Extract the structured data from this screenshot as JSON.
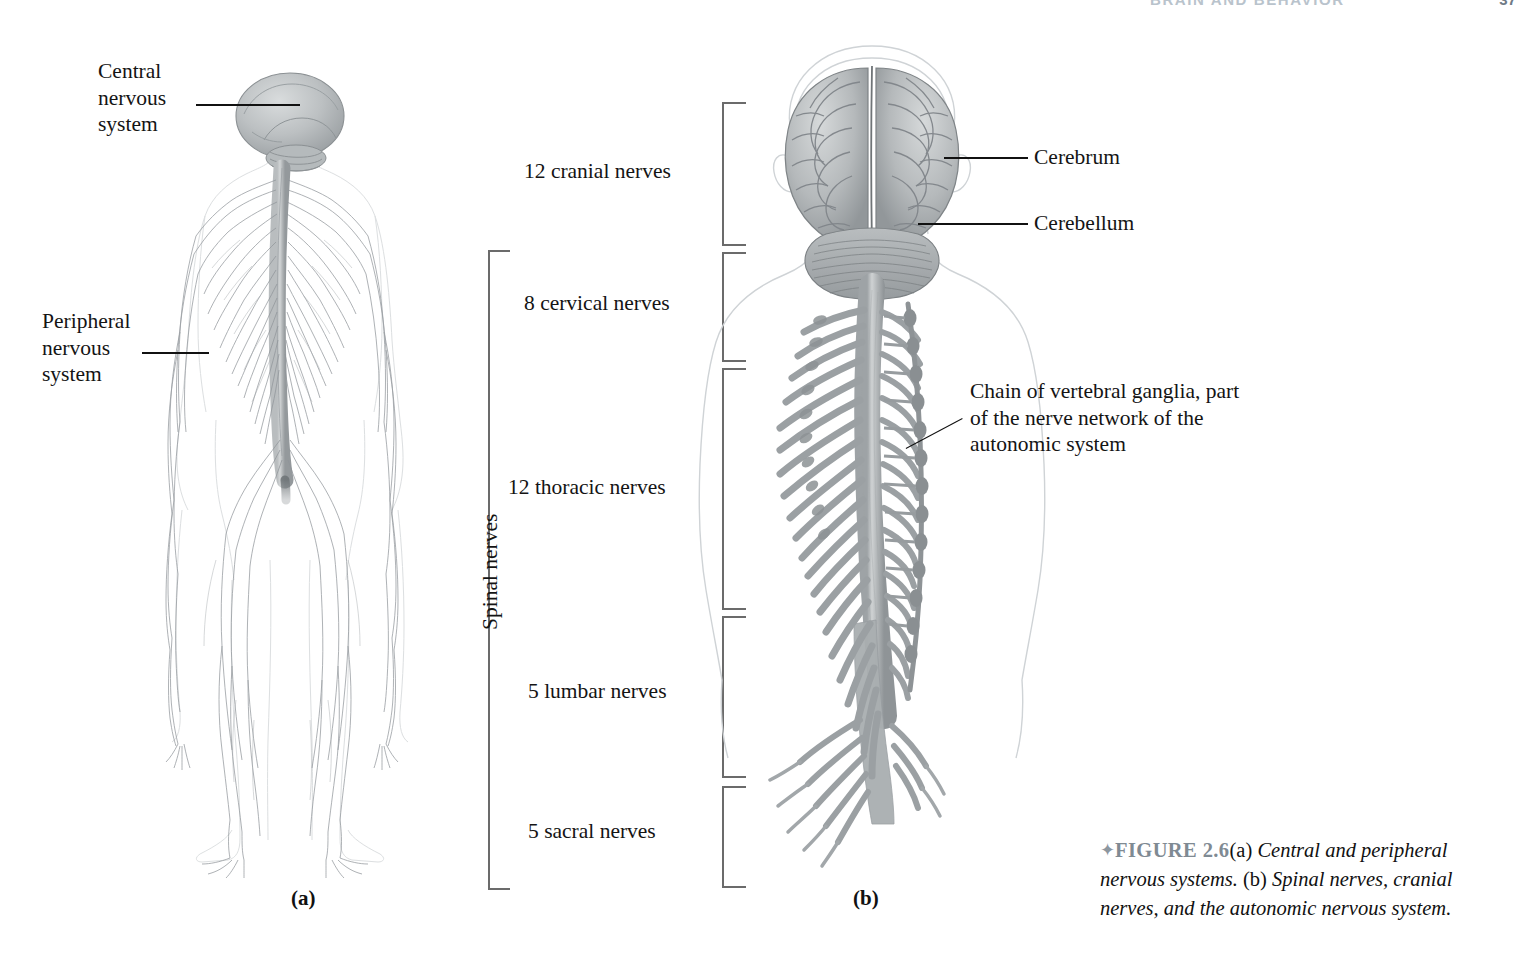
{
  "running_head": {
    "text": "BRAIN AND BEHAVIOR",
    "page": "37"
  },
  "panel_a": {
    "letter": "(a)",
    "labels": [
      {
        "id": "central-nervous-system",
        "text": "Central\nnervous\nsystem"
      },
      {
        "id": "peripheral-nervous-system",
        "text": "Peripheral\nnervous\nsystem"
      }
    ]
  },
  "panel_b": {
    "letter": "(b)",
    "labels": [
      {
        "id": "cerebrum",
        "text": "Cerebrum"
      },
      {
        "id": "cerebellum",
        "text": "Cerebellum"
      },
      {
        "id": "vertebral-ganglia",
        "text": "Chain of vertebral ganglia, part\nof the nerve network of the\nautonomic system"
      }
    ]
  },
  "nerve_groups": {
    "spinal_bracket_label": "Spinal nerves",
    "items": [
      {
        "id": "cranial",
        "label": "12 cranial nerves"
      },
      {
        "id": "cervical",
        "label": "8 cervical nerves"
      },
      {
        "id": "thoracic",
        "label": "12 thoracic nerves"
      },
      {
        "id": "lumbar",
        "label": "5 lumbar nerves"
      },
      {
        "id": "sacral",
        "label": "5 sacral nerves"
      }
    ]
  },
  "caption": {
    "bullet": "✦",
    "figure_number": "FIGURE 2.6",
    "body_a": "(a) ",
    "body_a_italic": "Central and peripheral nervous systems.",
    "body_b": " (b) ",
    "body_b_italic": "Spinal nerves, cranial nerves, and the autonomic nervous system."
  },
  "colors": {
    "ink": "#141414",
    "bracket": "#6b6b6b",
    "nerve_gray": "#9aa0a3",
    "cord_gray": "#a7abad",
    "brain_gray": "#b3b7b9",
    "caption_figure": "#7f8a93",
    "outline": "#c9cdd0"
  }
}
